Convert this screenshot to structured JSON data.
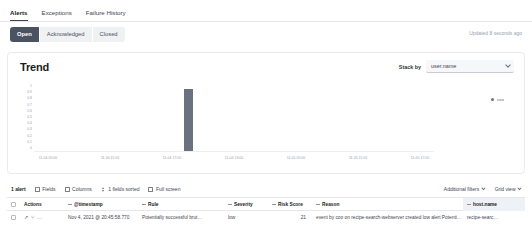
{
  "tabs": [
    {
      "label": "Alerts",
      "active": true
    },
    {
      "label": "Exceptions",
      "active": false
    },
    {
      "label": "Failure History",
      "active": false
    }
  ],
  "status_filters": [
    {
      "label": "Open",
      "selected": true
    },
    {
      "label": "Acknowledged",
      "selected": false
    },
    {
      "label": "Closed",
      "selected": false
    }
  ],
  "updated_text": "Updated 8 seconds ago",
  "panel": {
    "title": "Trend",
    "stack_by_label": "Stack by",
    "stack_by_value": "user.name",
    "legend": [
      {
        "label": "coo",
        "color": "#6a717f"
      }
    ]
  },
  "chart_data": {
    "type": "bar",
    "title": "Trend",
    "xlabel": "",
    "ylabel": "",
    "ylim": [
      0,
      1
    ],
    "yticks": [
      "1",
      "0.9",
      "0.8",
      "0.7",
      "0.6",
      "0.5",
      "0.4",
      "0.3",
      "0.2",
      "0.1",
      "0"
    ],
    "categories": [
      "11-04 05:00",
      "11-04 11:00",
      "11-04 17:00",
      "11-04 23:00",
      "11-05 05:00",
      "11-05 11:00",
      "11-05 17:00"
    ],
    "xticks": [
      "11-04 05:00",
      "11-04 11:00",
      "11-04 17:00",
      "11-04 23:00",
      "11-05 05:00",
      "11-05 11:00",
      "11-05 17:00"
    ],
    "series": [
      {
        "name": "coo",
        "color": "#6a717f",
        "bars": [
          {
            "x_label": "11-04 20:45",
            "x_pct": 37.5,
            "value": 1
          }
        ]
      }
    ],
    "grid": false,
    "legend_position": "top-right"
  },
  "toolbar": {
    "alert_count": "1 alert",
    "fields_label": "Fields",
    "columns_label": "Columns",
    "sorted_label": "1 fields sorted",
    "fullscreen_label": "Full screen",
    "additional_filters_label": "Additional filters",
    "grid_view_label": "Grid view"
  },
  "table": {
    "columns": [
      {
        "key": "actions",
        "label": "Actions"
      },
      {
        "key": "timestamp",
        "label": "@timestamp"
      },
      {
        "key": "rule",
        "label": "Rule"
      },
      {
        "key": "severity",
        "label": "Severity"
      },
      {
        "key": "risk_score",
        "label": "Risk Score"
      },
      {
        "key": "reason",
        "label": "Reason"
      },
      {
        "key": "host",
        "label": "host.name"
      }
    ],
    "rows": [
      {
        "timestamp": "Nov 4, 2021 @ 20:45:58.770",
        "rule": "Potentially successful brut…",
        "severity": "low",
        "risk_score": "21",
        "reason": "event by coo on recipe-search-webserver created low alert Potentially suc…",
        "host": "recipe-searc…"
      }
    ],
    "row_actions": {
      "expand": "↗",
      "analyze": "⑂",
      "more": "…"
    }
  }
}
